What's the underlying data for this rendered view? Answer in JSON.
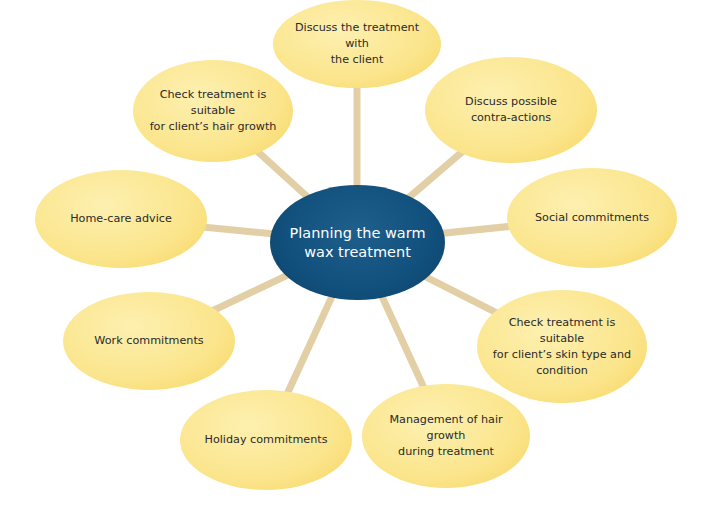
{
  "diagram": {
    "type": "spider-diagram",
    "center": {
      "label_line1": "Planning the warm",
      "label_line2": "wax treatment"
    },
    "colors": {
      "center_fill": "#11507c",
      "node_fill": "#fbe58c",
      "spoke": "#e2cfa6",
      "center_text": "#ffffff",
      "node_text": "#2a2a2a"
    },
    "nodes": [
      {
        "id": "discuss-treatment",
        "lines": [
          "Discuss the treatment with",
          "the client"
        ]
      },
      {
        "id": "contra-actions",
        "lines": [
          "Discuss possible",
          "contra-actions"
        ]
      },
      {
        "id": "social",
        "lines": [
          "Social commitments"
        ]
      },
      {
        "id": "skin-type",
        "lines": [
          "Check treatment is suitable",
          "for client’s skin type and",
          "condition"
        ]
      },
      {
        "id": "hair-growth-management",
        "lines": [
          "Management of hair growth",
          "during treatment"
        ]
      },
      {
        "id": "holiday",
        "lines": [
          "Holiday commitments"
        ]
      },
      {
        "id": "work",
        "lines": [
          "Work commitments"
        ]
      },
      {
        "id": "home-care",
        "lines": [
          "Home-care advice"
        ]
      },
      {
        "id": "hair-growth-suitable",
        "lines": [
          "Check treatment is suitable",
          "for client’s hair growth"
        ]
      }
    ]
  }
}
